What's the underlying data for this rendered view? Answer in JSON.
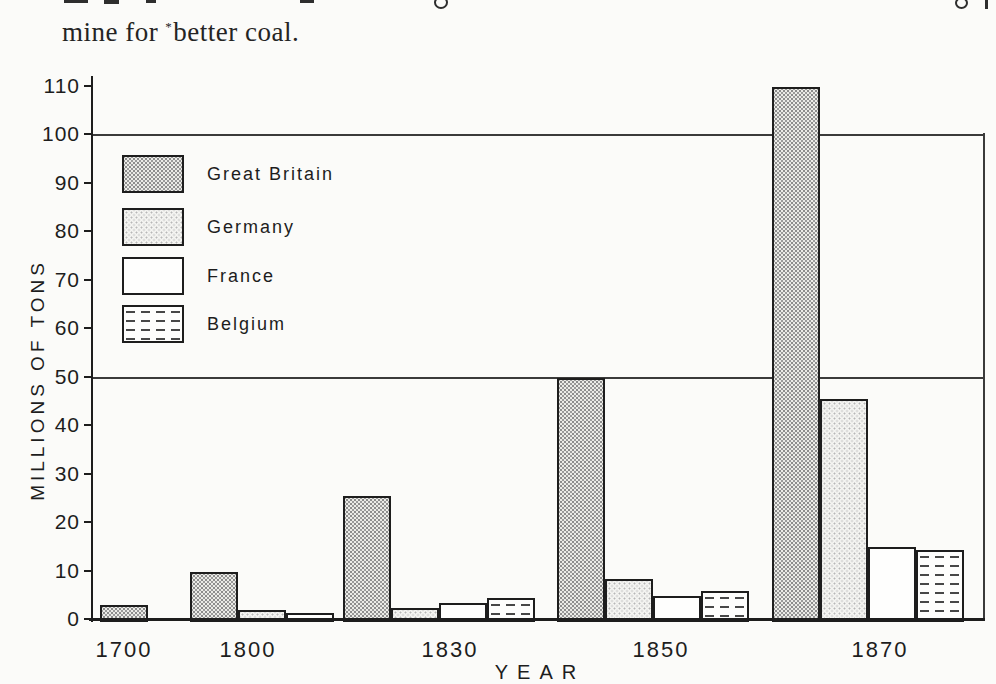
{
  "page": {
    "book_text": {
      "part1": "mine for",
      "footnote_mark": "*",
      "part2": "better coal."
    }
  },
  "chart_data": {
    "type": "bar",
    "title": "",
    "xlabel": "YEAR",
    "ylabel": "MILLIONS OF TONS",
    "units": "millions of tons",
    "ylim": [
      0,
      110
    ],
    "yticks": [
      0,
      10,
      20,
      30,
      40,
      50,
      60,
      70,
      80,
      90,
      100,
      110
    ],
    "gridlines_at": [
      50,
      100
    ],
    "grid": "horizontal-at-50-and-100-only",
    "legend_position": "upper-left-inside",
    "categories": [
      "1700",
      "1800",
      "1830",
      "1850",
      "1870"
    ],
    "series": [
      {
        "name": "Great Britain",
        "pattern": "stipple-dense",
        "values": [
          3,
          10,
          25.5,
          50,
          110
        ]
      },
      {
        "name": "Germany",
        "pattern": "stipple-light",
        "values": [
          null,
          2,
          2.5,
          8.5,
          45.5
        ]
      },
      {
        "name": "France",
        "pattern": "plain",
        "values": [
          null,
          1.5,
          3.5,
          5,
          15
        ]
      },
      {
        "name": "Belgium",
        "pattern": "dashes",
        "values": [
          null,
          null,
          4.5,
          6,
          14.5
        ]
      }
    ],
    "colors": {
      "ink": "#1d1d1d",
      "paper": "#fbfbf9"
    }
  }
}
